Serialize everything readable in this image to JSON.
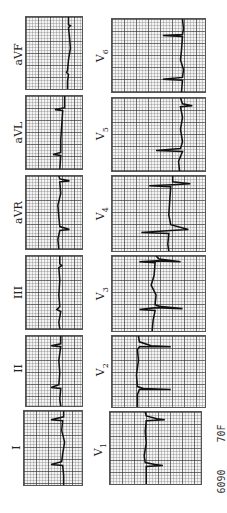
{
  "figure": {
    "type": "12-lead electrocardiogram strips (rotated 90° counter-clockwise)",
    "orientation": "rotated-ccw",
    "limb_leads": [
      {
        "label": "I"
      },
      {
        "label": "II"
      },
      {
        "label": "III"
      },
      {
        "label": "aVR"
      },
      {
        "label": "aVL"
      },
      {
        "label": "aVF"
      }
    ],
    "chest_leads": [
      {
        "label": "V",
        "sub": "1"
      },
      {
        "label": "V",
        "sub": "2"
      },
      {
        "label": "V",
        "sub": "3"
      },
      {
        "label": "V",
        "sub": "4"
      },
      {
        "label": "V",
        "sub": "5"
      },
      {
        "label": "V",
        "sub": "6"
      }
    ],
    "footer": {
      "id_number": "6090",
      "patient": "70F"
    },
    "colors": {
      "background": "#ffffff",
      "grid_major": "#3a3a3a",
      "grid_minor": "#8a8a8a",
      "trace": "#111111"
    }
  }
}
